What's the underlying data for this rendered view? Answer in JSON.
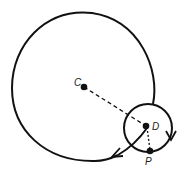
{
  "diagram": {
    "labels": {
      "C": "C",
      "D": "D",
      "P": "P"
    },
    "colors": {
      "stroke": "#111111",
      "background": "#ffffff"
    }
  }
}
